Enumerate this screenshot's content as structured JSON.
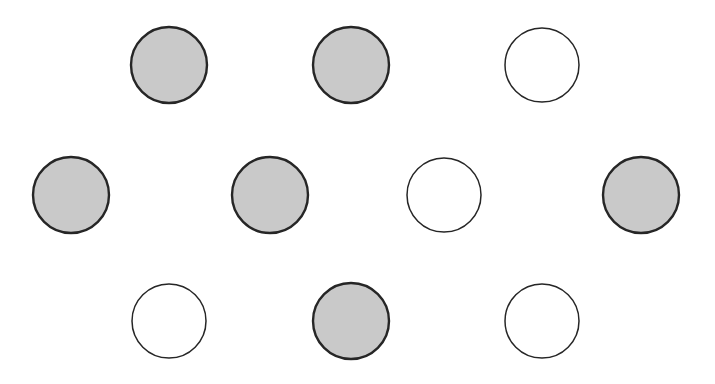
{
  "figure": {
    "background_color": "#FFFFFF",
    "width": 715,
    "height": 384,
    "filled_color": "#C9C9C9",
    "unfilled_color": "#FFFFFF",
    "stroke_color": "#262626",
    "filled_stroke_width": 2.4,
    "unfilled_stroke_width": 1.5,
    "radius": 38,
    "total_count": 10,
    "filled_count": 6,
    "unfilled_count": 4,
    "row_count": 3
  },
  "chart_data": {
    "type": "scatter",
    "xlabel": "",
    "ylabel": "",
    "xlim": [
      0,
      715
    ],
    "ylim": [
      0,
      384
    ],
    "grid": false,
    "legend": null,
    "series": [
      {
        "name": "filled",
        "marker": "circle",
        "fill": "#C9C9C9",
        "stroke": "#262626",
        "values": [
          {
            "x": 169,
            "y": 65,
            "r": 38
          },
          {
            "x": 351,
            "y": 65,
            "r": 38
          },
          {
            "x": 71,
            "y": 195,
            "r": 38
          },
          {
            "x": 270,
            "y": 195,
            "r": 38
          },
          {
            "x": 641,
            "y": 195,
            "r": 38
          },
          {
            "x": 351,
            "y": 321,
            "r": 38
          }
        ]
      },
      {
        "name": "unfilled",
        "marker": "circle",
        "fill": "#FFFFFF",
        "stroke": "#262626",
        "values": [
          {
            "x": 542,
            "y": 65,
            "r": 37
          },
          {
            "x": 444,
            "y": 195,
            "r": 37
          },
          {
            "x": 169,
            "y": 321,
            "r": 37
          },
          {
            "x": 542,
            "y": 321,
            "r": 37
          }
        ]
      }
    ],
    "rows": [
      {
        "row_index": 0,
        "label": "top-row",
        "y": 65,
        "circles": [
          {
            "x": 169,
            "state": "filled"
          },
          {
            "x": 351,
            "state": "filled"
          },
          {
            "x": 542,
            "state": "unfilled"
          }
        ]
      },
      {
        "row_index": 1,
        "label": "middle-row",
        "y": 195,
        "circles": [
          {
            "x": 71,
            "state": "filled"
          },
          {
            "x": 270,
            "state": "filled"
          },
          {
            "x": 444,
            "state": "unfilled"
          },
          {
            "x": 641,
            "state": "filled"
          }
        ]
      },
      {
        "row_index": 2,
        "label": "bottom-row",
        "y": 321,
        "circles": [
          {
            "x": 169,
            "state": "unfilled"
          },
          {
            "x": 351,
            "state": "filled"
          },
          {
            "x": 542,
            "state": "unfilled"
          }
        ]
      }
    ]
  }
}
